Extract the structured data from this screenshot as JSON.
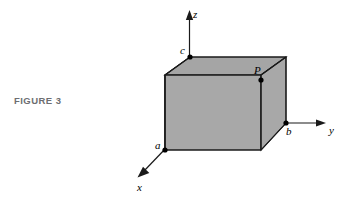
{
  "figure": {
    "caption": "FIGURE 3",
    "background_color": "#ffffff",
    "caption_color": "#6d6e71",
    "line_color": "#1a1a1a",
    "fill_color": "#a8a8a8"
  },
  "axes": {
    "z": {
      "label": "z",
      "direction": "up"
    },
    "y": {
      "label": "y",
      "direction": "right"
    },
    "x": {
      "label": "x",
      "direction": "down-left"
    }
  },
  "points": {
    "a": {
      "label": "a",
      "description": "x-axis intercept, front-bottom-left corner"
    },
    "b": {
      "label": "b",
      "description": "y-axis intercept, back-bottom-right corner"
    },
    "c": {
      "label": "c",
      "description": "z-axis intercept, back-top-left corner"
    },
    "P": {
      "label": "P",
      "description": "front-top-right corner of the box"
    }
  }
}
